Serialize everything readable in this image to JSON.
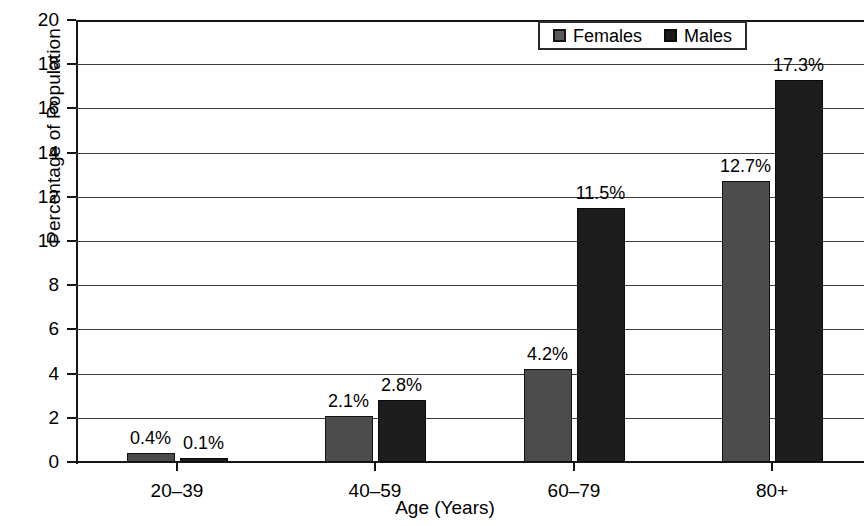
{
  "chart_data": {
    "type": "bar",
    "title": "",
    "subtitle": "",
    "xlabel": "Age (Years)",
    "ylabel": "Percentage of Population",
    "categories": [
      "20–39",
      "40–59",
      "60–79",
      "80+"
    ],
    "series": [
      {
        "name": "Females",
        "color": "#4c4c4c",
        "values": [
          0.4,
          2.1,
          4.2,
          12.7
        ],
        "labels": [
          "0.4%",
          "2.1%",
          "4.2%",
          "12.7%"
        ]
      },
      {
        "name": "Males",
        "color": "#1d1d1d",
        "values": [
          0.1,
          2.8,
          11.5,
          17.3
        ],
        "labels": [
          "0.1%",
          "2.8%",
          "11.5%",
          "17.3%"
        ]
      }
    ],
    "ylim": [
      0,
      20
    ],
    "ytick_step": 2,
    "ytick_labels": [
      "20",
      "18",
      "16",
      "14",
      "12",
      "10",
      "8",
      "6",
      "4",
      "2",
      "0"
    ],
    "grid": true,
    "grid_axis": "y",
    "legend_position": "top-right",
    "data_labels": true
  },
  "legend": {
    "entries": [
      {
        "label": "Females",
        "swatch": "females-swatch"
      },
      {
        "label": "Males",
        "swatch": "males-swatch"
      }
    ]
  }
}
